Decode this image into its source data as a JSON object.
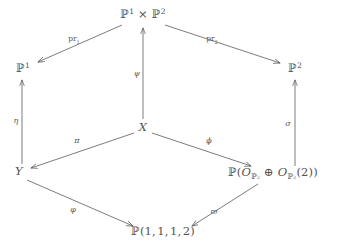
{
  "figure": {
    "kind": "commutative-diagram",
    "width": 339,
    "height": 247,
    "background_color": "#ffffff",
    "ink_color": "#555252"
  },
  "nodes": {
    "p1xp2": {
      "label": "P1 x P2",
      "x": 143,
      "y": 14
    },
    "p1": {
      "label": "P1",
      "x": 23,
      "y": 68
    },
    "p2": {
      "label": "P2",
      "x": 295,
      "y": 68
    },
    "x": {
      "label": "X",
      "x": 143,
      "y": 128
    },
    "y": {
      "label": "Y",
      "x": 19,
      "y": 172
    },
    "pbundle": {
      "label": "P(O_P2 + O_P2(2))",
      "x": 273,
      "y": 174
    },
    "weighted": {
      "label": "P(1,1,1,2)",
      "x": 163,
      "y": 232
    }
  },
  "arrow_labels": {
    "pr1": "pr",
    "pr1_sub": "1",
    "pr2": "pr",
    "pr2_sub": "2",
    "psi": "ψ",
    "eta": "η",
    "sigma": "σ",
    "pi": "π",
    "phi": "ϕ",
    "varphi": "φ",
    "varpi": "ϖ"
  },
  "arrows": [
    {
      "name": "p1xp2-to-p1",
      "from": "p1xp2",
      "to": "p1",
      "label": "pr1"
    },
    {
      "name": "p1xp2-to-p2",
      "from": "p1xp2",
      "to": "p2",
      "label": "pr2"
    },
    {
      "name": "x-to-p1xp2",
      "from": "x",
      "to": "p1xp2",
      "label": "psi"
    },
    {
      "name": "y-to-p1",
      "from": "y",
      "to": "p1",
      "label": "eta"
    },
    {
      "name": "pbundle-to-p2",
      "from": "pbundle",
      "to": "p2",
      "label": "sigma"
    },
    {
      "name": "x-to-y",
      "from": "x",
      "to": "y",
      "label": "pi"
    },
    {
      "name": "x-to-pbundle",
      "from": "x",
      "to": "pbundle",
      "label": "phi"
    },
    {
      "name": "y-to-weighted",
      "from": "y",
      "to": "weighted",
      "label": "varphi"
    },
    {
      "name": "pbundle-to-weighted",
      "from": "pbundle",
      "to": "weighted",
      "label": "varpi"
    }
  ],
  "label_positions": {
    "pr1": {
      "x": 74,
      "y": 40
    },
    "pr2": {
      "x": 212,
      "y": 40
    },
    "psi": {
      "x": 137,
      "y": 74
    },
    "eta": {
      "x": 16,
      "y": 121
    },
    "sigma": {
      "x": 288,
      "y": 124
    },
    "pi": {
      "x": 77,
      "y": 141
    },
    "phi": {
      "x": 209,
      "y": 141
    },
    "varphi": {
      "x": 73,
      "y": 210
    },
    "varpi": {
      "x": 214,
      "y": 212
    }
  }
}
